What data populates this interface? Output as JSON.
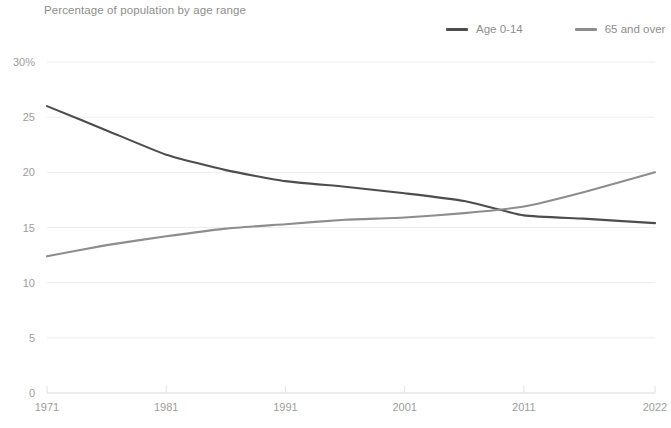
{
  "chart_title": "Percentage of population by age range",
  "legend": {
    "position": "top-right",
    "items": [
      {
        "label": "Age 0-14",
        "color": "#4d4d4d",
        "icon": "line-swatch-icon"
      },
      {
        "label": "65 and over",
        "color": "#8d8d8d",
        "icon": "line-swatch-icon"
      }
    ]
  },
  "axes": {
    "y_ticks": [
      "0",
      "5",
      "10",
      "15",
      "20",
      "25",
      "30%"
    ],
    "x_ticks": [
      "1971",
      "1981",
      "1991",
      "2001",
      "2011",
      "2022"
    ]
  },
  "chart_data": {
    "type": "line",
    "title": "Percentage of population by age range",
    "xlabel": "",
    "ylabel": "",
    "xlim": [
      1971,
      2022
    ],
    "ylim": [
      0,
      30
    ],
    "grid": true,
    "legend_position": "top-right",
    "x": [
      1971,
      1976,
      1981,
      1986,
      1991,
      1996,
      2001,
      2006,
      2011,
      2016,
      2022
    ],
    "series": [
      {
        "name": "Age 0-14",
        "color": "#4d4d4d",
        "values": [
          26.0,
          23.8,
          21.6,
          20.2,
          19.2,
          18.7,
          18.1,
          17.4,
          16.1,
          15.8,
          15.4
        ]
      },
      {
        "name": "65 and over",
        "color": "#8d8d8d",
        "values": [
          12.4,
          13.4,
          14.2,
          14.9,
          15.3,
          15.7,
          15.9,
          16.3,
          16.9,
          18.2,
          20.0
        ]
      }
    ]
  },
  "style": {
    "background": "#ffffff",
    "grid_color": "#ededed",
    "axis_color": "#e2e2e2",
    "tick_text_color": "#9d9d9d",
    "title_color": "#8e8e8e"
  }
}
